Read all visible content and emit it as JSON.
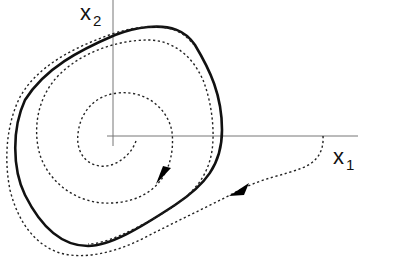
{
  "diagram": {
    "type": "phase-portrait",
    "axes": {
      "x_axis": {
        "label": "x",
        "subscript": "1"
      },
      "y_axis": {
        "label": "x",
        "subscript": "2"
      }
    },
    "elements": [
      {
        "name": "limit-cycle",
        "style": "solid",
        "color": "#111111"
      },
      {
        "name": "inner-trajectory",
        "style": "dotted",
        "color": "#222222",
        "direction": "spiraling outward toward limit cycle"
      },
      {
        "name": "outer-trajectory",
        "style": "dotted",
        "color": "#222222",
        "direction": "spiraling inward toward limit cycle"
      }
    ],
    "colors": {
      "axis": "#777777",
      "curve": "#111111",
      "dotted": "#222222",
      "background": "#ffffff"
    }
  }
}
